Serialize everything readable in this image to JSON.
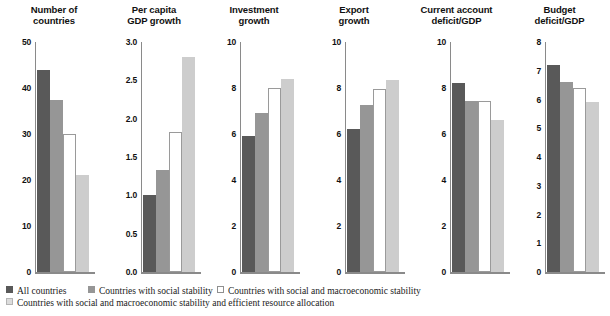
{
  "figure": {
    "background": "#ffffff",
    "panel_count": 6
  },
  "legend": {
    "position": "bottom-left",
    "rows": [
      [
        {
          "swatch": "dark-gray-filled-square",
          "color": "#595959",
          "label": "All countries"
        },
        {
          "swatch": "medium-gray-filled-square",
          "color": "#969696",
          "label": "Countries with social stability"
        },
        {
          "swatch": "white-outlined-square",
          "color": "#ffffff",
          "label": "Countries with social and macroeconomic stability"
        }
      ],
      [
        {
          "swatch": "light-gray-filled-square",
          "color": "#dcdcdc",
          "label": "Countries with social and macroeconomic stability and efficient resource allocation"
        }
      ]
    ]
  },
  "chart_data": [
    {
      "type": "bar",
      "title": "Number of countries",
      "title_lines": [
        "Number of",
        "countries"
      ],
      "xlabel": "",
      "ylabel": "",
      "ylim": [
        0,
        50
      ],
      "yticks": [
        "0",
        "10",
        "20",
        "30",
        "40",
        "50"
      ],
      "ytick_values": [
        0,
        10,
        20,
        30,
        40,
        50
      ],
      "grid": false,
      "categories": [
        "All countries",
        "Countries with social stability",
        "Countries with social and macroeconomic stability",
        "Countries with social and macroeconomic stability and efficient resource allocation"
      ],
      "values": [
        44,
        37.5,
        30,
        21
      ]
    },
    {
      "type": "bar",
      "title": "Per capita GDP growth",
      "title_lines": [
        "Per capita",
        "GDP growth"
      ],
      "xlabel": "",
      "ylabel": "",
      "ylim": [
        0,
        3.0
      ],
      "yticks": [
        "0.0",
        "0.5",
        "1.0",
        "1.5",
        "2.0",
        "2.5",
        "3.0"
      ],
      "ytick_values": [
        0,
        0.5,
        1.0,
        1.5,
        2.0,
        2.5,
        3.0
      ],
      "grid": false,
      "categories": [
        "All countries",
        "Countries with social stability",
        "Countries with social and macroeconomic stability",
        "Countries with social and macroeconomic stability and efficient resource allocation"
      ],
      "values": [
        1.0,
        1.33,
        1.82,
        2.81
      ]
    },
    {
      "type": "bar",
      "title": "Investment growth",
      "title_lines": [
        "Investment",
        "growth"
      ],
      "xlabel": "",
      "ylabel": "",
      "ylim": [
        0,
        10
      ],
      "yticks": [
        "0",
        "2",
        "4",
        "6",
        "8",
        "10"
      ],
      "ytick_values": [
        0,
        2,
        4,
        6,
        8,
        10
      ],
      "grid": false,
      "categories": [
        "All countries",
        "Countries with social stability",
        "Countries with social and macroeconomic stability",
        "Countries with social and macroeconomic stability and efficient resource allocation"
      ],
      "values": [
        5.9,
        6.9,
        8.0,
        8.4
      ]
    },
    {
      "type": "bar",
      "title": "Export growth",
      "title_lines": [
        "Export",
        "growth"
      ],
      "xlabel": "",
      "ylabel": "",
      "ylim": [
        0,
        10
      ],
      "yticks": [
        "0",
        "2",
        "4",
        "6",
        "8",
        "10"
      ],
      "ytick_values": [
        0,
        2,
        4,
        6,
        8,
        10
      ],
      "grid": false,
      "categories": [
        "All countries",
        "Countries with social stability",
        "Countries with social and macroeconomic stability",
        "Countries with social and macroeconomic stability and efficient resource allocation"
      ],
      "values": [
        6.2,
        7.25,
        7.95,
        8.35
      ]
    },
    {
      "type": "bar",
      "title": "Current account deficit/GDP",
      "title_lines": [
        "Current account",
        "deficit/GDP"
      ],
      "xlabel": "",
      "ylabel": "",
      "ylim": [
        0,
        10
      ],
      "yticks": [
        "0",
        "2",
        "4",
        "6",
        "8",
        "10"
      ],
      "ytick_values": [
        0,
        2,
        4,
        6,
        8,
        10
      ],
      "grid": false,
      "categories": [
        "All countries",
        "Countries with social stability",
        "Countries with social and macroeconomic stability",
        "Countries with social and macroeconomic stability and efficient resource allocation"
      ],
      "values": [
        8.2,
        7.45,
        7.45,
        6.6
      ]
    },
    {
      "type": "bar",
      "title": "Budget deficit/GDP",
      "title_lines": [
        "Budget",
        "deficit/GDP"
      ],
      "xlabel": "",
      "ylabel": "",
      "ylim": [
        0,
        8
      ],
      "yticks": [
        "0",
        "1",
        "2",
        "3",
        "4",
        "5",
        "6",
        "7",
        "8"
      ],
      "ytick_values": [
        0,
        1,
        2,
        3,
        4,
        5,
        6,
        7,
        8
      ],
      "grid": false,
      "categories": [
        "All countries",
        "Countries with social stability",
        "Countries with social and macroeconomic stability",
        "Countries with social and macroeconomic stability and efficient resource allocation"
      ],
      "values": [
        7.2,
        6.6,
        6.4,
        5.9
      ]
    }
  ]
}
